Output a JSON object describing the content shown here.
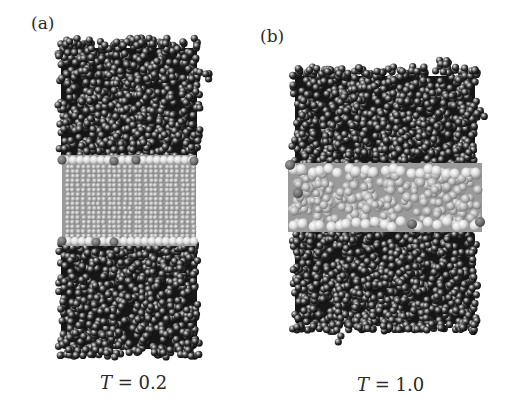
{
  "figure": {
    "panels": [
      {
        "id": "a",
        "label": "(a)",
        "caption_var": "T",
        "caption_eq": " = 0.2",
        "temperature": 0.2,
        "phase_description": "ordered lipid bilayer between water slabs",
        "label_pos": [
          31,
          15
        ],
        "caption_pos": [
          100,
          374
        ],
        "water_region": {
          "x0": 58,
          "x1": 200,
          "y0": 40,
          "y1": 355
        },
        "bilayer": {
          "x0": 62,
          "x1": 196,
          "y0": 155,
          "y1": 246,
          "ordered": true
        },
        "stray_clusters": [
          [
            205,
            75
          ],
          [
            140,
            42
          ]
        ],
        "bottom_tails": []
      },
      {
        "id": "b",
        "label": "(b)",
        "caption_var": "T",
        "caption_eq": " = 1.0",
        "temperature": 1.0,
        "phase_description": "disordered lipid bilayer between water slabs",
        "label_pos": [
          260,
          28
        ],
        "caption_pos": [
          357,
          376
        ],
        "water_region": {
          "x0": 292,
          "x1": 478,
          "y0": 68,
          "y1": 330
        },
        "bilayer": {
          "x0": 288,
          "x1": 482,
          "y0": 163,
          "y1": 232,
          "ordered": false
        },
        "stray_clusters": [
          [
            445,
            60
          ],
          [
            480,
            113
          ],
          [
            326,
            68
          ],
          [
            363,
            70
          ]
        ],
        "bottom_tails": [
          [
            337,
            300,
            345
          ],
          [
            430,
            300,
            335
          ]
        ]
      }
    ],
    "colors": {
      "water_bead": "#2b2b2b",
      "water_highlight": "#d8d8d8",
      "head_bead": "#e6e6e6",
      "head_dark_bead": "#6a6a6a",
      "tail_bead": "#b5b5b5",
      "background": "#ffffff"
    }
  }
}
